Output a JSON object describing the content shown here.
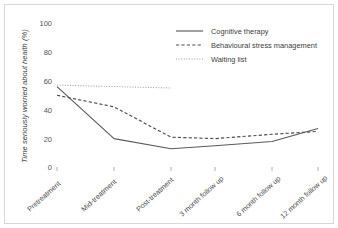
{
  "chart_data": {
    "type": "line",
    "title": "",
    "xlabel": "",
    "ylabel": "Time seriously worried about health (%)",
    "categories": [
      "Pretreatment",
      "Mid-treatment",
      "Post-treatment",
      "3 month follow up",
      "6 month follow up",
      "12 month follow up"
    ],
    "ylim": [
      0,
      100
    ],
    "yticks": [
      "0",
      "20",
      "40",
      "60",
      "80",
      "100"
    ],
    "ytick_values": [
      0,
      20,
      40,
      60,
      80,
      100
    ],
    "grid": false,
    "legend_position": "top-right",
    "series": [
      {
        "name": "Cognitive therapy",
        "style": "solid",
        "color": "#5a5a5a",
        "values": [
          56,
          20,
          13,
          15,
          18,
          27
        ]
      },
      {
        "name": "Behavioural stress management",
        "style": "dashed",
        "color": "#4d4d4d",
        "values": [
          50,
          42,
          21,
          20,
          23,
          25
        ]
      },
      {
        "name": "Waiting list",
        "style": "dotted",
        "color": "#9a9a9a",
        "values": [
          57,
          56,
          55,
          null,
          null,
          null
        ]
      }
    ]
  },
  "axis": {
    "y_title": "Time seriously worried about health (%)",
    "y_ticks": [
      "100",
      "80",
      "60",
      "40",
      "20",
      "0"
    ],
    "x_ticks": [
      "Pretreatment",
      "Mid-treatment",
      "Post-treatment",
      "3 month follow up",
      "6 month follow up",
      "12 month follow up"
    ]
  },
  "legend": {
    "items": [
      {
        "label": "Cognitive therapy",
        "style": "solid"
      },
      {
        "label": "Behavioural stress management",
        "style": "dashed"
      },
      {
        "label": "Waiting list",
        "style": "dotted"
      }
    ]
  }
}
